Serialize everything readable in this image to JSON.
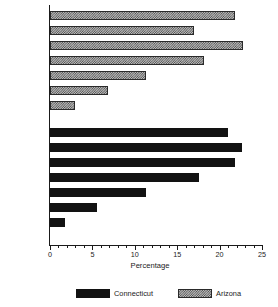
{
  "chart_data": {
    "type": "bar",
    "orientation": "horizontal",
    "title": "",
    "xlabel": "Percentage",
    "ylabel": "",
    "xlim": [
      0,
      25
    ],
    "xticks": [
      0,
      5,
      10,
      15,
      20,
      25
    ],
    "xticklabels": [
      "0",
      "5",
      "10",
      "15",
      "20",
      "25"
    ],
    "minor_tick_step": 1,
    "grid": false,
    "categories": [
      "Very great",
      "6",
      "5",
      "4",
      "3",
      "2",
      "None"
    ],
    "series": [
      {
        "name": "Arizona",
        "color": "#bcbcbc",
        "pattern": "checkerboard",
        "panel": "top",
        "values": [
          21.8,
          17.0,
          22.8,
          18.2,
          11.3,
          6.8,
          2.9
        ]
      },
      {
        "name": "Connecticut",
        "color": "#121212",
        "pattern": "solid",
        "panel": "bottom",
        "values": [
          21.0,
          22.6,
          21.8,
          17.6,
          11.3,
          5.5,
          1.8
        ]
      }
    ],
    "legend": {
      "position": "bottom",
      "entries": [
        {
          "label": "Connecticut",
          "swatch": "solid-black"
        },
        {
          "label": "Arizona",
          "swatch": "checkerboard-gray"
        }
      ]
    }
  }
}
